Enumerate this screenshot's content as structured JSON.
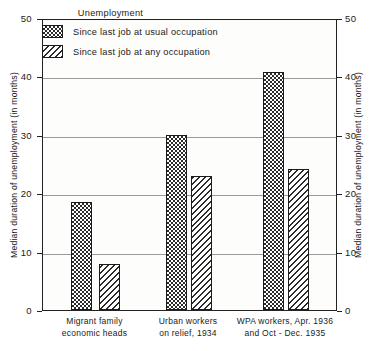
{
  "chart_data": {
    "type": "bar",
    "title": "",
    "legend_title": "Unemployment",
    "legend_position": "top-center-inside",
    "grid": true,
    "xlabel": "",
    "ylabel": "Median duration of unemployment (in months)",
    "ylabel_right": "Median duration of unemployment (in months)",
    "ylim": [
      0,
      50
    ],
    "yticks": [
      0,
      10,
      20,
      30,
      40,
      50
    ],
    "ytick_labels": [
      "0",
      "10",
      "20",
      "30",
      "40",
      "50"
    ],
    "categories": [
      "Migrant family economic heads",
      "Urban workers on relief, 1934",
      "WPA workers, Apr. 1936 and Oct - Dec. 1935"
    ],
    "category_lines": [
      [
        "Migrant  family",
        "economic  heads"
      ],
      [
        "Urban workers",
        "on relief, 1934"
      ],
      [
        "WPA workers,  Apr. 1936",
        "and Oct - Dec. 1935"
      ]
    ],
    "series": [
      {
        "name": "Since last job at usual occupation",
        "pattern": "checkerboard",
        "values": [
          18.5,
          30.0,
          40.8
        ]
      },
      {
        "name": "Since last job at any occupation",
        "pattern": "diagonal-hatch",
        "values": [
          7.8,
          23.0,
          24.1
        ]
      }
    ]
  },
  "style": {
    "axis_color": "#222222",
    "grid_color": "#9a9a9a",
    "bar_ink": "#2b2b2b",
    "background": "#ffffff",
    "plot_background": "#fdfdfc"
  }
}
